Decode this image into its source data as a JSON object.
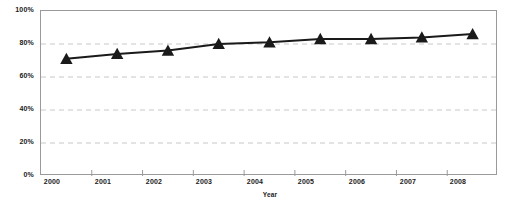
{
  "chart_data": {
    "type": "line",
    "title": "",
    "subtitle": "",
    "xlabel": "Year",
    "ylabel": "",
    "categories": [
      "2000",
      "2001",
      "2002",
      "2003",
      "2004",
      "2005",
      "2006",
      "2007",
      "2008"
    ],
    "series": [
      {
        "name": "",
        "values": [
          71,
          74,
          76,
          80,
          81,
          83,
          83,
          84,
          86
        ],
        "marker": "triangle",
        "color": "#1a1a1a",
        "line_width": 2
      }
    ],
    "ylim": [
      0,
      100
    ],
    "yticks": [
      0,
      20,
      40,
      60,
      80,
      100
    ],
    "ytick_labels": [
      "0%",
      "20%",
      "40%",
      "60%",
      "80%",
      "100%"
    ],
    "grid": {
      "horizontal": true,
      "vertical": false,
      "style": "dashed",
      "color": "#c8c8c8"
    },
    "legend": {
      "visible": false,
      "position": "none"
    },
    "axis_color": "#9a9a9a",
    "background": "#ffffff",
    "plot_background": "#ffffff"
  }
}
